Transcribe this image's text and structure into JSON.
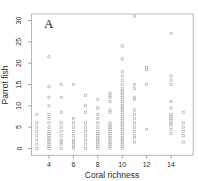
{
  "panel_label": "A",
  "chart_data": {
    "type": "scatter",
    "title": "",
    "xlabel": "Coral richness",
    "ylabel": "Parrot fish",
    "xlim": [
      2.5,
      15.8
    ],
    "ylim": [
      -1.5,
      31.5
    ],
    "xticks": [
      4,
      6,
      8,
      10,
      12,
      14
    ],
    "yticks": [
      0,
      5,
      10,
      15,
      20,
      25,
      30
    ],
    "grid": false,
    "legend": "none",
    "marker": "open-square",
    "marker_color": "#b3b3b3",
    "box_color": "#a6a6a6",
    "tick_color": "#8f8f8f",
    "text_color": "#2b2b2b",
    "groups": [
      {
        "x": 3,
        "y": [
          0,
          1,
          2,
          3,
          4,
          5,
          6,
          8
        ]
      },
      {
        "x": 4,
        "y": [
          0,
          0.5,
          1,
          1.5,
          2,
          2.5,
          3,
          3.5,
          4,
          5,
          6,
          7,
          8,
          10,
          12,
          14.5,
          21.5
        ]
      },
      {
        "x": 5,
        "y": [
          0,
          1,
          1.5,
          2,
          3,
          4,
          5,
          6,
          8.5,
          12,
          15
        ]
      },
      {
        "x": 6,
        "y": [
          0,
          0.5,
          1,
          1.5,
          2,
          3,
          4,
          5,
          6,
          7,
          15
        ]
      },
      {
        "x": 7,
        "y": [
          0,
          1,
          2,
          3,
          4,
          5,
          6,
          8.5,
          10,
          12.5
        ]
      },
      {
        "x": 8,
        "y": [
          0,
          0.5,
          1,
          1.5,
          2,
          2.5,
          3,
          3.5,
          4,
          5,
          6,
          7,
          8,
          9.5,
          11.5
        ]
      },
      {
        "x": 9,
        "y": [
          0,
          0.5,
          1,
          1.5,
          2,
          2.5,
          3,
          3.5,
          4,
          4.5,
          5,
          5.5,
          6,
          8.5,
          9,
          11,
          12,
          12.5,
          13
        ]
      },
      {
        "x": 10,
        "y": [
          0,
          0.5,
          1,
          1.5,
          2,
          2.5,
          3,
          3.5,
          4,
          4.5,
          5,
          5.5,
          6,
          6.5,
          7,
          7.5,
          8,
          8.5,
          9,
          9.5,
          10,
          10.5,
          11,
          11.5,
          12,
          12.5,
          13,
          13.5,
          14,
          15,
          16,
          17,
          18,
          21,
          24
        ]
      },
      {
        "x": 11,
        "y": [
          1.5,
          2.5,
          3,
          4,
          5,
          6,
          7,
          8,
          9,
          11.5,
          12,
          14,
          15,
          31
        ]
      },
      {
        "x": 12,
        "y": [
          4.5,
          15,
          18.5,
          19
        ]
      },
      {
        "x": 14,
        "y": [
          3.5,
          4.5,
          5.5,
          6,
          6.5,
          7,
          7.5,
          8,
          9.5,
          11,
          15,
          16,
          17,
          27
        ]
      },
      {
        "x": 15,
        "y": [
          1.5,
          3,
          4,
          5,
          6,
          8.5
        ]
      }
    ]
  }
}
